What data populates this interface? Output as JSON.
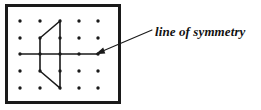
{
  "figure": {
    "background_color": "#ffffff",
    "ink_color": "#1a1a1a",
    "width": 261,
    "height": 110,
    "annotation": {
      "label": "line of symmetry",
      "style": "bold italic serif",
      "color": "#111111"
    },
    "board": {
      "name": "geoboard-frame",
      "x": 5,
      "y": 4,
      "width": 116,
      "height": 100,
      "border_width": 3,
      "border_color": "#1a1a1a",
      "fill": "#ffffff"
    },
    "peg_grid": {
      "columns": 5,
      "rows": 5,
      "column_x": [
        20,
        40,
        60,
        79,
        98
      ],
      "row_y": [
        21,
        38,
        54,
        71,
        88
      ],
      "dot_radius": 1.7,
      "dot_color": "#1a1a1a",
      "total_pegs": 25
    },
    "symmetry_line": {
      "name": "horizontal-symmetry-line",
      "from": [
        20,
        54
      ],
      "to": [
        98,
        54
      ],
      "stroke_width": 1.6
    },
    "polygon": {
      "name": "symmetric-polygon",
      "vertices": [
        [
          60,
          21
        ],
        [
          40,
          38
        ],
        [
          40,
          71
        ],
        [
          60,
          88
        ]
      ],
      "closing_edge": [
        [
          60,
          88
        ],
        [
          60,
          21
        ]
      ],
      "stroke_width": 1.6,
      "fill": "none"
    },
    "leader_arrow": {
      "name": "annotation-leader-arrow",
      "tail": [
        152,
        30
      ],
      "tip": [
        96,
        54
      ],
      "stroke_width": 1.1,
      "head_length": 9,
      "head_width": 5
    }
  }
}
